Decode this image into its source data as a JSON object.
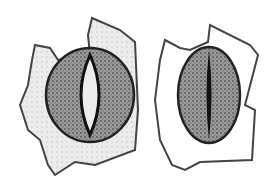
{
  "figure": {
    "panels": [
      {
        "id": "open-stoma",
        "state": "open"
      },
      {
        "id": "closed-stoma",
        "state": "closed"
      }
    ],
    "colors": {
      "background": "#ffffff",
      "cell_wall": "#3a3a3a",
      "guard_cell_fill": "#8a8a8a",
      "subsidiary_fill": "#e6e6e6",
      "pore": "#1a1a1a"
    }
  }
}
